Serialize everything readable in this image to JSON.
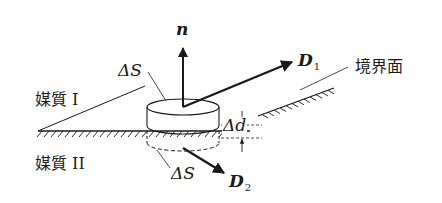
{
  "figure": {
    "type": "boundary-condition-pillbox",
    "colors": {
      "ink": "#1a1a1a",
      "background": "#ffffff"
    },
    "labels": {
      "medium_1": "媒質 I",
      "medium_2": "媒質 II",
      "boundary": "境界面",
      "normal_vector": "n",
      "top_area": "ΔS",
      "bottom_area": "ΔS",
      "thickness": "Δd",
      "field_1": {
        "symbol": "D",
        "subscript": "1"
      },
      "field_2": {
        "symbol": "D",
        "subscript": "2"
      }
    }
  }
}
